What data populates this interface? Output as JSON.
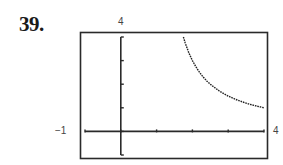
{
  "problem": {
    "number": "39."
  },
  "window": {
    "xmin_label": "−1",
    "xmax_label": "4",
    "ymax_label": "4"
  },
  "chart_data": {
    "type": "line",
    "title": "",
    "xlabel": "",
    "ylabel": "",
    "xlim": [
      -1,
      4
    ],
    "ylim": [
      -1,
      4
    ],
    "xscale_tick": 1,
    "yscale_tick": 1,
    "grid": false,
    "frame": true,
    "function": "y = 3/(x - 1)",
    "series": [
      {
        "name": "curve",
        "style": "dotted-dark",
        "x": [
          1.75,
          1.8,
          1.9,
          2.0,
          2.1,
          2.2,
          2.3,
          2.4,
          2.5,
          2.6,
          2.75,
          2.9,
          3.0,
          3.2,
          3.4,
          3.6,
          3.8,
          4.0
        ],
        "y": [
          4.0,
          3.75,
          3.33,
          3.0,
          2.73,
          2.5,
          2.31,
          2.14,
          2.0,
          1.88,
          1.71,
          1.58,
          1.5,
          1.36,
          1.25,
          1.15,
          1.07,
          1.0
        ]
      }
    ],
    "tick_labels": {
      "x_min": "-1",
      "x_max": "4",
      "y_max": "4"
    }
  }
}
